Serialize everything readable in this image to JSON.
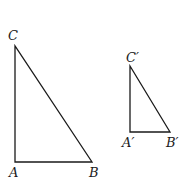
{
  "diagram": {
    "type": "similar-triangles",
    "triangles": [
      {
        "name": "ABC",
        "vertices": {
          "A": {
            "label": "A",
            "x": 15,
            "y": 162
          },
          "B": {
            "label": "B",
            "x": 92,
            "y": 162
          },
          "C": {
            "label": "C",
            "x": 15,
            "y": 46
          }
        },
        "right_angle_at": "A"
      },
      {
        "name": "A'B'C'",
        "vertices": {
          "A": {
            "label": "A′",
            "x": 130,
            "y": 132
          },
          "B": {
            "label": "B′",
            "x": 170,
            "y": 132
          },
          "C": {
            "label": "C′",
            "x": 130,
            "y": 66
          }
        },
        "right_angle_at": "A'"
      }
    ],
    "stroke_color": "#1a1a1a",
    "background": "#ffffff"
  }
}
